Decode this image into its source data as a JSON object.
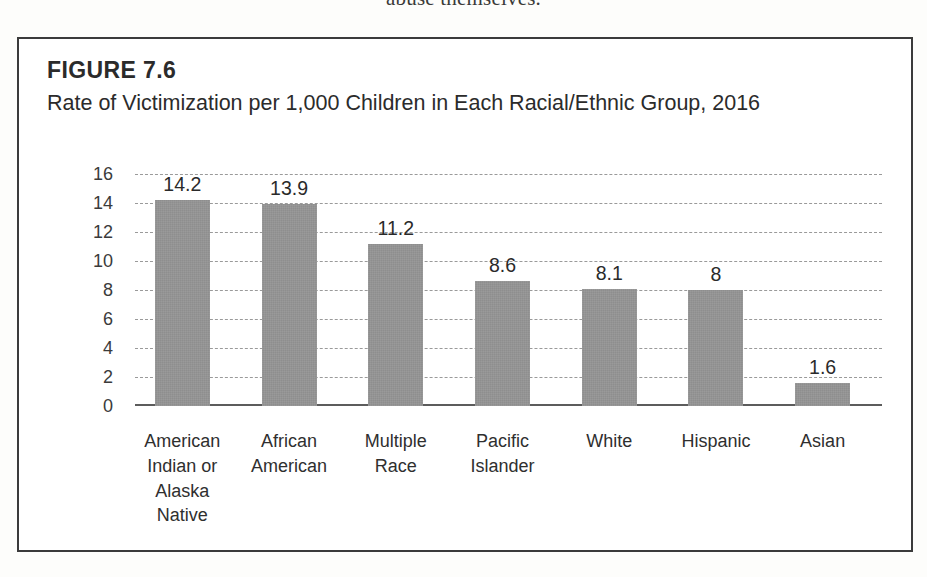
{
  "page_bleed_text": "abuse themselves.",
  "figure": {
    "number_label": "FIGURE 7.6",
    "caption": "Rate of Victimization per 1,000 Children in Each Racial/Ethnic Group, 2016",
    "border_color": "#3b3b3b",
    "background_color": "#ffffff"
  },
  "chart_data": {
    "type": "bar",
    "title": "Rate of Victimization per 1,000 Children in Each Racial/Ethnic Group, 2016",
    "xlabel": "",
    "ylabel": "",
    "ylim": [
      0,
      16
    ],
    "yticks": [
      16,
      14,
      12,
      10,
      8,
      6,
      4,
      2,
      0
    ],
    "grid": true,
    "legend": false,
    "bar_color": "#8e8e8e",
    "categories": [
      "American Indian or Alaska Native",
      "African American",
      "Multiple Race",
      "Pacific Islander",
      "White",
      "Hispanic",
      "Asian"
    ],
    "category_lines": [
      [
        "American",
        "Indian or",
        "Alaska",
        "Native"
      ],
      [
        "African",
        "American"
      ],
      [
        "Multiple",
        "Race"
      ],
      [
        "Pacific",
        "Islander"
      ],
      [
        "White"
      ],
      [
        "Hispanic"
      ],
      [
        "Asian"
      ]
    ],
    "values": [
      14.2,
      13.9,
      11.2,
      8.6,
      8.1,
      8,
      1.6
    ],
    "value_labels": [
      "14.2",
      "13.9",
      "11.2",
      "8.6",
      "8.1",
      "8",
      "1.6"
    ]
  }
}
